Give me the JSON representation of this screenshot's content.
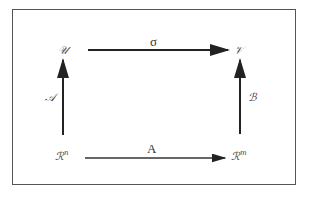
{
  "diagram": {
    "nodes": {
      "top_left": {
        "label": "𝒰"
      },
      "top_right": {
        "label": "𝒱"
      },
      "bottom_left": {
        "label": "ℛ",
        "sup": "n"
      },
      "bottom_right": {
        "label": "ℛ",
        "sup": "m"
      }
    },
    "edges": {
      "top": {
        "label": "σ",
        "from": "bottom_left",
        "to": "top_right"
      },
      "bottom": {
        "label": "A"
      },
      "left": {
        "label": "𝒜"
      },
      "right": {
        "label": "ℬ"
      }
    },
    "colors": {
      "arrow": "#222222",
      "border": "#555555"
    }
  }
}
